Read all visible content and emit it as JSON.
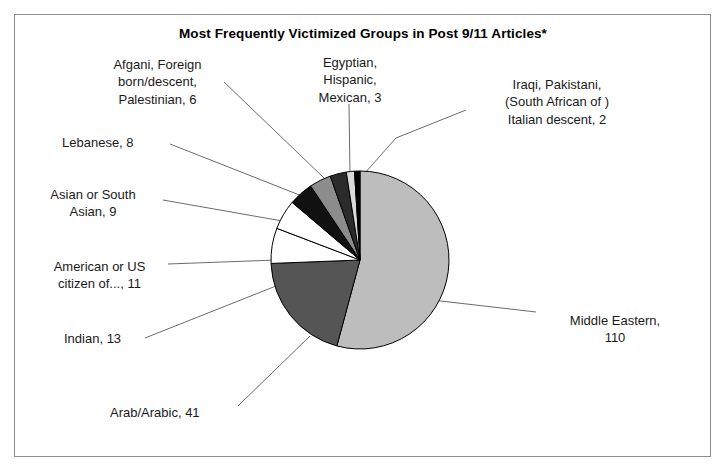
{
  "chart_data": {
    "type": "pie",
    "title": "Most Frequently Victimized Groups in Post 9/11 Articles*",
    "categories": [
      "Middle Eastern",
      "Arab/Arabic",
      "Indian",
      "American or US citizen of...",
      "Asian or South Asian",
      "Lebanese",
      "Afgani, Foreign born/descent, Palestinian",
      "Egyptian, Hispanic, Mexican",
      "Iraqi, Pakistani, (South African of ) Italian descent"
    ],
    "values": [
      110,
      41,
      13,
      11,
      9,
      8,
      6,
      3,
      2
    ],
    "total": 203,
    "labels": [
      "Middle Eastern,\n110",
      "Arab/Arabic, 41",
      "Indian, 13",
      "American or US\ncitizen of..., 11",
      "Asian or South\nAsian, 9",
      "Lebanese, 8",
      "Afgani, Foreign\nborn/descent,\nPalestinian, 6",
      "Egyptian,\nHispanic,\nMexican, 3",
      "Iraqi, Pakistani,\n(South African of )\nItalian descent, 2"
    ],
    "colors": [
      "#bdbdbd",
      "#555555",
      "#ffffff",
      "#ffffff",
      "#111111",
      "#8c8c8c",
      "#2b2b2b",
      "#d9d9d9",
      "#000000"
    ],
    "legend": "none",
    "grid": false,
    "xlabel": "",
    "ylabel": "",
    "footnote_marker": "*"
  },
  "geometry": {
    "center_x": 360,
    "center_y": 260,
    "radius": 89,
    "start_angle_deg": -90
  },
  "label_positions": [
    {
      "name": "middle-eastern",
      "x": 540,
      "y": 312,
      "align": "lbl-center",
      "width": 150
    },
    {
      "name": "arab-arabic",
      "x": 110,
      "y": 404,
      "align": "lbl-right",
      "width": 130
    },
    {
      "name": "indian",
      "x": 64,
      "y": 330,
      "align": "lbl-right",
      "width": 80
    },
    {
      "name": "american-or-us-citizen",
      "x": 32,
      "y": 258,
      "align": "lbl-center",
      "width": 135
    },
    {
      "name": "asian-or-south-asian",
      "x": 28,
      "y": 186,
      "align": "lbl-center",
      "width": 130
    },
    {
      "name": "lebanese",
      "x": 62,
      "y": 134,
      "align": "lbl-right",
      "width": 105
    },
    {
      "name": "afgani-foreign-born",
      "x": 90,
      "y": 56,
      "align": "lbl-center",
      "width": 135
    },
    {
      "name": "egyptian-hispanic-mexican",
      "x": 290,
      "y": 54,
      "align": "lbl-center",
      "width": 120
    },
    {
      "name": "iraqi-pakistani",
      "x": 472,
      "y": 76,
      "align": "lbl-center",
      "width": 170
    }
  ],
  "leader_lines": [
    {
      "name": "leader-middle-eastern",
      "x1": 536,
      "y1": 312,
      "x2": 432,
      "y2": 300
    },
    {
      "name": "leader-arab-arabic",
      "x1": 238,
      "y1": 406,
      "x2": 310,
      "y2": 336
    },
    {
      "name": "leader-indian",
      "x1": 145,
      "y1": 338,
      "x2": 276,
      "y2": 286
    },
    {
      "name": "leader-american",
      "x1": 168,
      "y1": 264,
      "x2": 277,
      "y2": 260
    },
    {
      "name": "leader-asian",
      "x1": 163,
      "y1": 200,
      "x2": 288,
      "y2": 222
    },
    {
      "name": "leader-lebanese",
      "x1": 170,
      "y1": 144,
      "x2": 302,
      "y2": 196
    },
    {
      "name": "leader-afgani",
      "x1": 224,
      "y1": 82,
      "x2": 324,
      "y2": 178
    },
    {
      "name": "leader-egyptian",
      "x1": 349,
      "y1": 104,
      "x2": 350,
      "y2": 176
    },
    {
      "name": "leader-iraqi",
      "x1": 466,
      "y1": 110,
      "x2": 396,
      "y2": 138
    },
    {
      "name": "leader-iraqi-2",
      "x1": 396,
      "y1": 138,
      "x2": 364,
      "y2": 174
    }
  ]
}
